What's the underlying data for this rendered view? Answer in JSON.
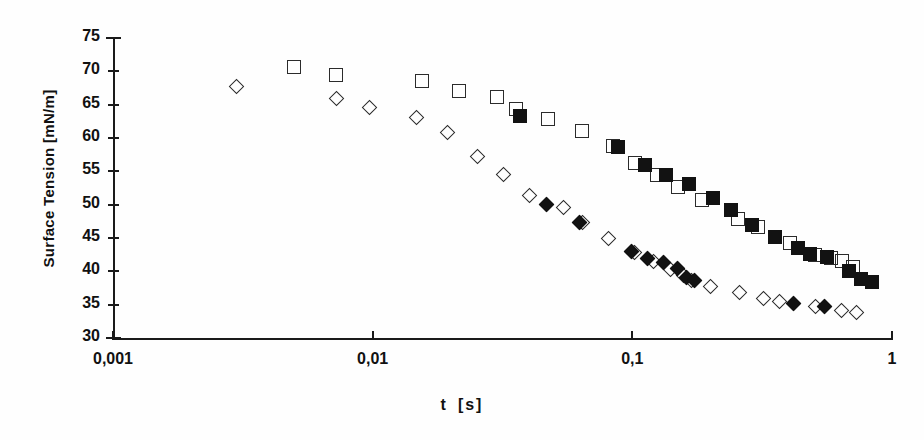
{
  "chart_data": {
    "type": "scatter",
    "title": "",
    "xlabel": "t   [s]",
    "xlabel_symbol": "t",
    "xlabel_unit": "[s]",
    "ylabel": "Surface Tension [mN/m]",
    "xscale": "log",
    "yscale": "linear",
    "xlim": [
      0.001,
      1
    ],
    "ylim": [
      30,
      75
    ],
    "grid": false,
    "legend": "none",
    "xticks": [
      0.001,
      0.01,
      0.1,
      1
    ],
    "xtick_labels": [
      "0,001",
      "0,01",
      "0,1",
      "1"
    ],
    "yticks": [
      30,
      35,
      40,
      45,
      50,
      55,
      60,
      65,
      70,
      75
    ],
    "ytick_labels": [
      "30",
      "35",
      "40",
      "45",
      "50",
      "55",
      "60",
      "65",
      "70",
      "75"
    ],
    "marker_color": "#121212",
    "series": [
      {
        "name": "open-squares",
        "marker": "square-open",
        "points": [
          [
            0.005,
            70.6
          ],
          [
            0.0072,
            69.5
          ],
          [
            0.0155,
            68.5
          ],
          [
            0.0215,
            67.1
          ],
          [
            0.03,
            66.1
          ],
          [
            0.0355,
            64.4
          ],
          [
            0.0475,
            62.9
          ],
          [
            0.064,
            61.1
          ],
          [
            0.084,
            58.8
          ],
          [
            0.102,
            56.2
          ],
          [
            0.125,
            54.5
          ],
          [
            0.15,
            52.7
          ],
          [
            0.185,
            50.7
          ],
          [
            0.255,
            47.8
          ],
          [
            0.305,
            46.7
          ],
          [
            0.405,
            44.2
          ],
          [
            0.505,
            42.5
          ],
          [
            0.58,
            42.0
          ],
          [
            0.64,
            41.5
          ],
          [
            0.71,
            40.6
          ]
        ]
      },
      {
        "name": "filled-squares",
        "marker": "square-filled",
        "points": [
          [
            0.037,
            63.3
          ],
          [
            0.088,
            58.6
          ],
          [
            0.112,
            56.0
          ],
          [
            0.135,
            54.5
          ],
          [
            0.165,
            53.1
          ],
          [
            0.205,
            51.0
          ],
          [
            0.24,
            49.2
          ],
          [
            0.29,
            47.0
          ],
          [
            0.355,
            45.1
          ],
          [
            0.435,
            43.5
          ],
          [
            0.485,
            42.6
          ],
          [
            0.56,
            42.2
          ],
          [
            0.68,
            40.0
          ],
          [
            0.76,
            38.8
          ],
          [
            0.835,
            38.4
          ]
        ]
      },
      {
        "name": "open-diamonds",
        "marker": "diamond-open",
        "points": [
          [
            0.003,
            67.7
          ],
          [
            0.0073,
            65.8
          ],
          [
            0.0098,
            64.5
          ],
          [
            0.0148,
            63.0
          ],
          [
            0.0195,
            60.7
          ],
          [
            0.0255,
            57.2
          ],
          [
            0.032,
            54.5
          ],
          [
            0.0405,
            51.3
          ],
          [
            0.0545,
            49.5
          ],
          [
            0.0645,
            47.2
          ],
          [
            0.081,
            44.9
          ],
          [
            0.102,
            42.8
          ],
          [
            0.121,
            41.4
          ],
          [
            0.141,
            40.2
          ],
          [
            0.158,
            39.3
          ],
          [
            0.17,
            38.5
          ],
          [
            0.2,
            37.6
          ],
          [
            0.26,
            36.7
          ],
          [
            0.32,
            35.9
          ],
          [
            0.37,
            35.4
          ],
          [
            0.51,
            34.7
          ],
          [
            0.64,
            34.1
          ],
          [
            0.73,
            33.8
          ]
        ]
      },
      {
        "name": "filled-diamonds",
        "marker": "diamond-filled",
        "points": [
          [
            0.047,
            49.9
          ],
          [
            0.063,
            47.3
          ],
          [
            0.1,
            42.9
          ],
          [
            0.115,
            41.8
          ],
          [
            0.132,
            41.2
          ],
          [
            0.15,
            40.3
          ],
          [
            0.162,
            39.0
          ],
          [
            0.175,
            38.6
          ],
          [
            0.42,
            35.1
          ],
          [
            0.55,
            34.7
          ]
        ]
      }
    ]
  }
}
